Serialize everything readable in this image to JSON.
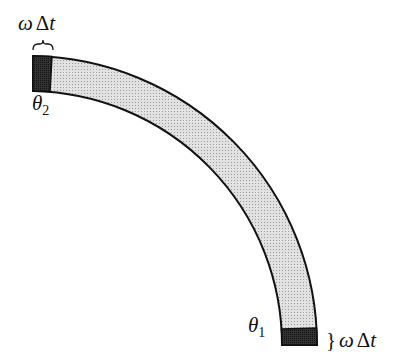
{
  "diagram": {
    "colors": {
      "band_fill": "#d9d9d9",
      "end_fill": "#2a2a2a",
      "stroke": "#111111"
    },
    "labels": {
      "top_omega": "ω",
      "top_delta": "Δ",
      "top_t": "t",
      "theta2_symbol": "θ",
      "theta2_sub": "2",
      "theta1_symbol": "θ",
      "theta1_sub": "1",
      "bottom_omega": "ω",
      "bottom_delta": "Δ",
      "bottom_t": "t",
      "bottom_brace": "}"
    }
  }
}
